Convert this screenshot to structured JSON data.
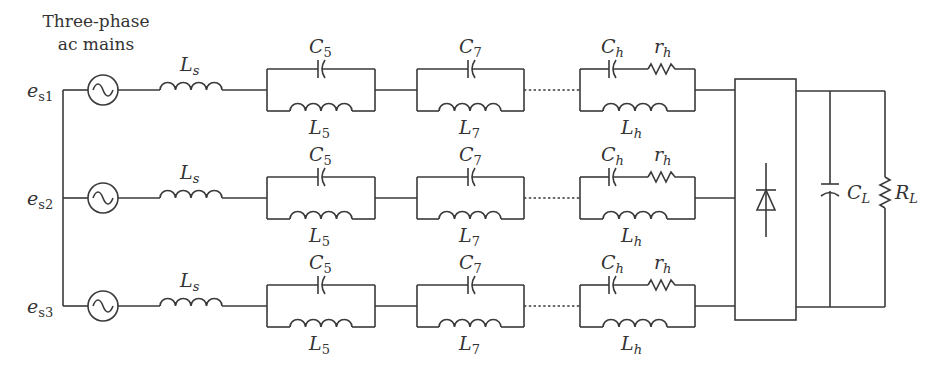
{
  "diagram": {
    "title_line1": "Three-phase",
    "title_line2": "ac mains",
    "stroke_color": "#3a3a3a",
    "background": "#ffffff",
    "sources": [
      {
        "label": "e",
        "sub": "s1",
        "icon": "ac-source-icon"
      },
      {
        "label": "e",
        "sub": "s2",
        "icon": "ac-source-icon"
      },
      {
        "label": "e",
        "sub": "s3",
        "icon": "ac-source-icon"
      }
    ],
    "line_inductor": {
      "label": "L",
      "sub": "s"
    },
    "filters": {
      "f5": {
        "cap": {
          "label": "C",
          "sub": "5"
        },
        "ind": {
          "label": "L",
          "sub": "5"
        }
      },
      "f7": {
        "cap": {
          "label": "C",
          "sub": "7"
        },
        "ind": {
          "label": "L",
          "sub": "7"
        }
      },
      "fh": {
        "cap": {
          "label": "C",
          "sub": "h"
        },
        "res": {
          "label": "r",
          "sub": "h"
        },
        "ind": {
          "label": "L",
          "sub": "h"
        }
      }
    },
    "rectifier": {
      "icon": "diode-icon"
    },
    "load": {
      "cap": {
        "label": "C",
        "sub": "L"
      },
      "res": {
        "label": "R",
        "sub": "L"
      }
    }
  }
}
